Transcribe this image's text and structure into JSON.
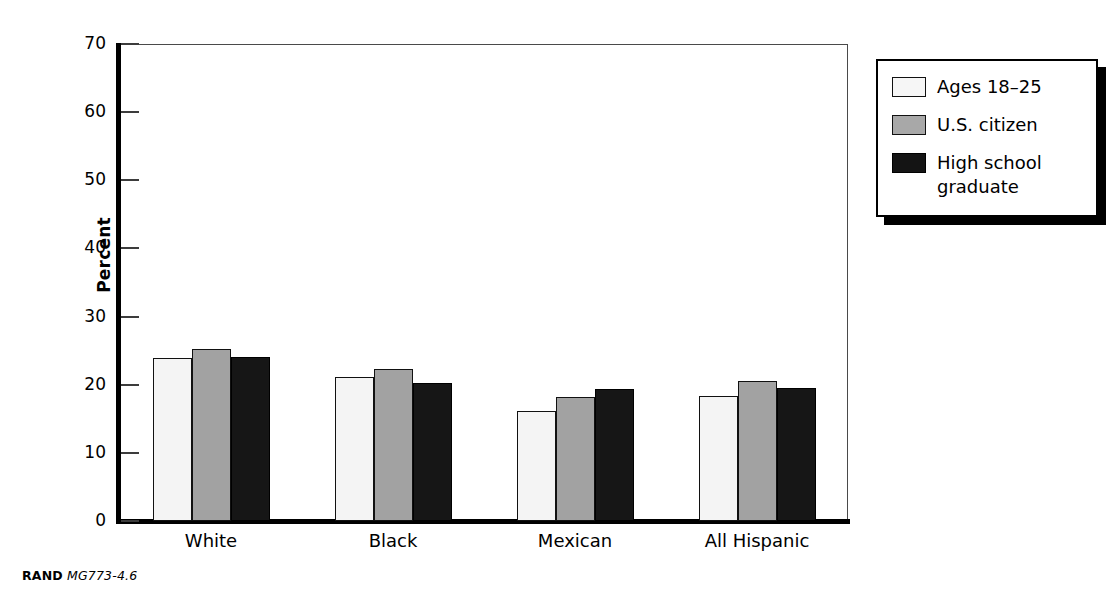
{
  "chart_data": {
    "type": "bar",
    "title": "",
    "xlabel": "",
    "ylabel": "Percent",
    "ylim": [
      0,
      70
    ],
    "yticks": [
      0,
      10,
      20,
      30,
      40,
      50,
      60,
      70
    ],
    "grid": false,
    "legend_position": "right-outside",
    "categories": [
      "White",
      "Black",
      "Mexican",
      "All Hispanic"
    ],
    "series": [
      {
        "name": "Ages 18–25",
        "color": "#f4f4f4",
        "values": [
          23.9,
          21.2,
          16.1,
          18.3
        ]
      },
      {
        "name": "U.S. citizen",
        "color": "#a2a2a2",
        "values": [
          25.2,
          22.3,
          18.2,
          20.5
        ]
      },
      {
        "name": "High school graduate",
        "color": "#161616",
        "values": [
          24.0,
          20.2,
          19.3,
          19.5
        ]
      }
    ]
  },
  "axis": {
    "y_title": "Percent",
    "y_tick_labels": [
      "70",
      "60",
      "50",
      "40",
      "30",
      "20",
      "10",
      "0"
    ],
    "x_tick_labels": [
      "White",
      "Black",
      "Mexican",
      "All Hispanic"
    ]
  },
  "legend": {
    "items": [
      {
        "label": "Ages 18–25",
        "swatch": "legend-swatch-light"
      },
      {
        "label": "U.S. citizen",
        "swatch": "legend-swatch-gray"
      },
      {
        "label": "High school\ngraduate",
        "swatch": "legend-swatch-black"
      }
    ]
  },
  "caption": {
    "brand": "RAND",
    "id": "MG773-4.6"
  }
}
